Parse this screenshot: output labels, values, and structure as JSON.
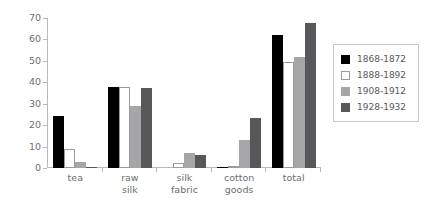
{
  "chart_data": {
    "type": "bar",
    "title": "",
    "subtitle": "",
    "xlabel": "",
    "ylabel": "",
    "ylim": [
      0,
      70
    ],
    "yticks": [
      0,
      10,
      20,
      30,
      40,
      50,
      60,
      70
    ],
    "ytick_labels": [
      "0",
      "10",
      "20",
      "30",
      "40",
      "50",
      "60",
      "70"
    ],
    "grid": false,
    "legend_position": "right",
    "categories": [
      "tea",
      "raw silk",
      "silk fabric",
      "cotton goods",
      "total"
    ],
    "category_lines": [
      [
        "tea"
      ],
      [
        "raw",
        "silk"
      ],
      [
        "silk",
        "fabric"
      ],
      [
        "cotton",
        "goods"
      ],
      [
        "total"
      ]
    ],
    "series": [
      {
        "name": "1868-1872",
        "color": "#000000",
        "values": [
          24.5,
          38.0,
          0.0,
          0.5,
          62.0
        ]
      },
      {
        "name": "1888-1892",
        "color": "#ffffff",
        "values": [
          9.0,
          38.0,
          2.5,
          0.0,
          49.5
        ]
      },
      {
        "name": "1908-1912",
        "color": "#a6a6a8",
        "values": [
          3.0,
          29.0,
          7.0,
          13.0,
          52.0
        ]
      },
      {
        "name": "1928-1932",
        "color": "#58585a",
        "values": [
          0.5,
          37.5,
          6.0,
          23.5,
          67.5
        ]
      }
    ]
  },
  "legend": {
    "items": [
      {
        "label": "1868-1872"
      },
      {
        "label": "1888-1892"
      },
      {
        "label": "1908-1912"
      },
      {
        "label": "1928-1932"
      }
    ]
  }
}
